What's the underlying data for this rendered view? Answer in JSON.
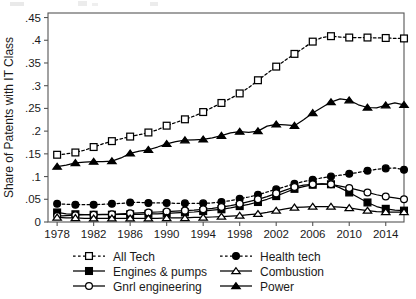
{
  "chart_data": {
    "type": "line",
    "title": "",
    "xlabel": "",
    "ylabel": "Share of Patents with IT Class",
    "xlim": [
      1977,
      2016
    ],
    "ylim": [
      0,
      0.46
    ],
    "grid": false,
    "legend_position": "bottom",
    "x_ticks": [
      "1978",
      "1982",
      "1986",
      "1990",
      "1994",
      "1998",
      "2002",
      "2006",
      "2010",
      "2014"
    ],
    "x_tick_values": [
      1978,
      1982,
      1986,
      1990,
      1994,
      1998,
      2002,
      2006,
      2010,
      2014
    ],
    "y_ticks": [
      "0",
      ".05",
      ".1",
      ".15",
      ".2",
      ".25",
      ".3",
      ".35",
      ".4",
      ".45"
    ],
    "y_tick_values": [
      0,
      0.05,
      0.1,
      0.15,
      0.2,
      0.25,
      0.3,
      0.35,
      0.4,
      0.45
    ],
    "x": [
      1978,
      1979,
      1980,
      1981,
      1982,
      1983,
      1984,
      1985,
      1986,
      1987,
      1988,
      1989,
      1990,
      1991,
      1992,
      1993,
      1994,
      1995,
      1996,
      1997,
      1998,
      1999,
      2000,
      2001,
      2002,
      2003,
      2004,
      2005,
      2006,
      2007,
      2008,
      2009,
      2010,
      2011,
      2012,
      2013,
      2014,
      2015,
      2016
    ],
    "series": [
      {
        "name": "All Tech",
        "marker": "open-square",
        "line": "dashed",
        "color": "#000000",
        "values": [
          0.148,
          0.15,
          0.153,
          0.158,
          0.165,
          0.172,
          0.178,
          0.183,
          0.188,
          0.192,
          0.197,
          0.203,
          0.212,
          0.219,
          0.226,
          0.233,
          0.242,
          0.252,
          0.262,
          0.272,
          0.283,
          0.296,
          0.312,
          0.327,
          0.342,
          0.356,
          0.37,
          0.383,
          0.397,
          0.406,
          0.409,
          0.407,
          0.406,
          0.406,
          0.406,
          0.405,
          0.405,
          0.404,
          0.404
        ]
      },
      {
        "name": "Health tech",
        "marker": "filled-circle",
        "line": "dashed",
        "color": "#000000",
        "values": [
          0.04,
          0.039,
          0.038,
          0.038,
          0.038,
          0.039,
          0.04,
          0.041,
          0.043,
          0.043,
          0.042,
          0.042,
          0.042,
          0.041,
          0.041,
          0.041,
          0.041,
          0.042,
          0.044,
          0.047,
          0.051,
          0.055,
          0.06,
          0.066,
          0.072,
          0.078,
          0.084,
          0.089,
          0.093,
          0.097,
          0.1,
          0.103,
          0.106,
          0.109,
          0.113,
          0.116,
          0.118,
          0.119,
          0.115
        ]
      },
      {
        "name": "Engines & pumps",
        "marker": "filled-square",
        "line": "solid",
        "color": "#000000",
        "values": [
          0.021,
          0.018,
          0.017,
          0.016,
          0.016,
          0.016,
          0.016,
          0.017,
          0.017,
          0.017,
          0.018,
          0.018,
          0.019,
          0.02,
          0.021,
          0.022,
          0.024,
          0.026,
          0.028,
          0.031,
          0.035,
          0.039,
          0.044,
          0.05,
          0.057,
          0.065,
          0.073,
          0.078,
          0.082,
          0.084,
          0.083,
          0.075,
          0.065,
          0.054,
          0.043,
          0.034,
          0.029,
          0.026,
          0.025
        ]
      },
      {
        "name": "Gnrl engineering",
        "marker": "open-circle",
        "line": "solid",
        "color": "#000000",
        "values": [
          0.013,
          0.014,
          0.015,
          0.016,
          0.016,
          0.017,
          0.017,
          0.018,
          0.019,
          0.02,
          0.021,
          0.022,
          0.023,
          0.024,
          0.025,
          0.026,
          0.028,
          0.03,
          0.033,
          0.036,
          0.04,
          0.045,
          0.05,
          0.056,
          0.063,
          0.07,
          0.077,
          0.081,
          0.083,
          0.084,
          0.083,
          0.079,
          0.075,
          0.07,
          0.065,
          0.06,
          0.056,
          0.053,
          0.05
        ]
      },
      {
        "name": "Combustion",
        "marker": "open-triangle",
        "line": "solid",
        "color": "#000000",
        "values": [
          0.01,
          0.009,
          0.009,
          0.008,
          0.008,
          0.008,
          0.008,
          0.008,
          0.008,
          0.008,
          0.008,
          0.008,
          0.009,
          0.009,
          0.009,
          0.01,
          0.01,
          0.011,
          0.012,
          0.013,
          0.014,
          0.016,
          0.018,
          0.021,
          0.025,
          0.029,
          0.032,
          0.033,
          0.034,
          0.034,
          0.034,
          0.033,
          0.031,
          0.028,
          0.025,
          0.023,
          0.022,
          0.022,
          0.022
        ]
      },
      {
        "name": "Power",
        "marker": "filled-triangle",
        "line": "solid",
        "color": "#000000",
        "values": [
          0.122,
          0.125,
          0.13,
          0.132,
          0.133,
          0.133,
          0.134,
          0.141,
          0.151,
          0.156,
          0.159,
          0.165,
          0.172,
          0.177,
          0.18,
          0.181,
          0.182,
          0.185,
          0.19,
          0.196,
          0.199,
          0.197,
          0.2,
          0.211,
          0.215,
          0.214,
          0.212,
          0.225,
          0.24,
          0.252,
          0.264,
          0.271,
          0.268,
          0.258,
          0.252,
          0.251,
          0.257,
          0.262,
          0.258
        ]
      }
    ]
  },
  "legend": {
    "entries": [
      {
        "label": "All Tech",
        "marker": "open-square",
        "line": "dashed"
      },
      {
        "label": "Health tech",
        "marker": "filled-circle",
        "line": "dashed"
      },
      {
        "label": "Engines & pumps",
        "marker": "filled-square",
        "line": "solid"
      },
      {
        "label": "Combustion",
        "marker": "open-triangle",
        "line": "solid"
      },
      {
        "label": "Gnrl engineering",
        "marker": "open-circle",
        "line": "solid"
      },
      {
        "label": "Power",
        "marker": "filled-triangle",
        "line": "solid"
      }
    ]
  },
  "axis": {
    "y_title": "Share of Patents with IT Class"
  },
  "style": {
    "frame_color": "#555555",
    "line_color": "#000000",
    "text_color": "#1a1a1a",
    "background": "#ffffff"
  }
}
